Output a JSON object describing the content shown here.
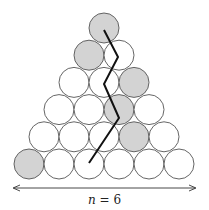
{
  "diagram": {
    "n_label_var": "n",
    "n_label_rest": " = 6",
    "rows": 6,
    "shaded": [
      [
        0,
        0
      ],
      [
        1,
        0
      ],
      [
        2,
        2
      ],
      [
        3,
        2
      ],
      [
        4,
        3
      ],
      [
        5,
        0
      ]
    ],
    "colors": {
      "shaded": "#d3d3d3",
      "stroke": "#555555",
      "path": "#111111"
    },
    "path_points": [
      [
        104,
        30
      ],
      [
        118,
        57
      ],
      [
        104,
        84
      ],
      [
        119,
        118
      ],
      [
        89,
        163
      ]
    ]
  }
}
